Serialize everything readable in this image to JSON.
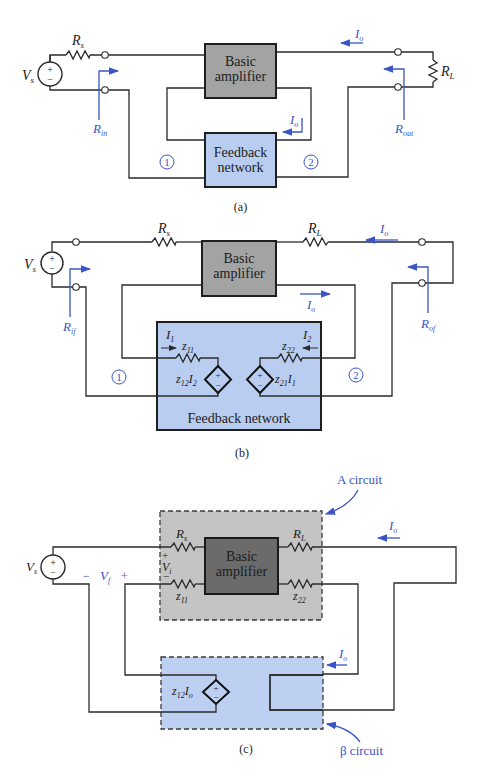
{
  "figure": {
    "panels": [
      {
        "caption": "(a)",
        "blocks": {
          "amplifier": [
            "Basic",
            "amplifier"
          ],
          "feedback": [
            "Feedback",
            "network"
          ]
        },
        "labels": {
          "source": "V",
          "source_sub": "s",
          "rs": "R",
          "rs_sub": "s",
          "rl": "R",
          "rl_sub": "L",
          "io_top": "I",
          "io_top_sub": "o",
          "io_mid": "I",
          "io_mid_sub": "o",
          "rin": "R",
          "rin_sub": "in",
          "rout": "R",
          "rout_sub": "out",
          "port1": "1",
          "port2": "2"
        }
      },
      {
        "caption": "(b)",
        "blocks": {
          "amplifier": [
            "Basic",
            "amplifier"
          ],
          "feedback": "Feedback network"
        },
        "labels": {
          "source": "V",
          "source_sub": "s",
          "rs": "R",
          "rs_sub": "s",
          "rl": "R",
          "rl_sub": "L",
          "io_top": "I",
          "io_top_sub": "o",
          "io_mid": "I",
          "io_mid_sub": "o",
          "rif": "R",
          "rif_sub": "if",
          "rof": "R",
          "rof_sub": "of",
          "i1": "I",
          "i1_sub": "1",
          "i2": "I",
          "i2_sub": "2",
          "z11": "z",
          "z11_sub": "11",
          "z22": "z",
          "z22_sub": "22",
          "z12i2": "z",
          "z12i2_sub": "12",
          "z12i2_var": "I",
          "z12i2_var_sub": "2",
          "z21i1": "z",
          "z21i1_sub": "21",
          "z21i1_var": "I",
          "z21i1_var_sub": "1",
          "port1": "1",
          "port2": "2"
        }
      },
      {
        "caption": "(c)",
        "blocks": {
          "amplifier": [
            "Basic",
            "amplifier"
          ],
          "a_circuit": "A circuit",
          "beta_circuit": "β circuit"
        },
        "labels": {
          "source": "V",
          "source_sub": "s",
          "rs": "R",
          "rs_sub": "s",
          "rl": "R",
          "rl_sub": "L",
          "vi": "V",
          "vi_sub": "i",
          "vf": "V",
          "vf_sub": "f",
          "vf_minus": "−",
          "vf_plus": "+",
          "vi_plus": "+",
          "vi_minus": "−",
          "z11": "z",
          "z11_sub": "11",
          "z22": "z",
          "z22_sub": "22",
          "io_top": "I",
          "io_top_sub": "o",
          "io_mid": "I",
          "io_mid_sub": "o",
          "z12io": "z",
          "z12io_sub": "12",
          "z12io_var": "I",
          "z12io_var_sub": "o"
        }
      }
    ],
    "colors": {
      "amplifier_fill": "#a3a3a3",
      "amplifier_dark_fill": "#6b6b6b",
      "feedback_fill": "#b9cdf0",
      "a_circuit_fill": "#c4c4c4",
      "beta_fill": "#bdd0f2",
      "annotation": "#3b55c8",
      "wire": "#2a2a2a"
    },
    "source_symbols": {
      "plus": "+",
      "minus": "−"
    }
  }
}
